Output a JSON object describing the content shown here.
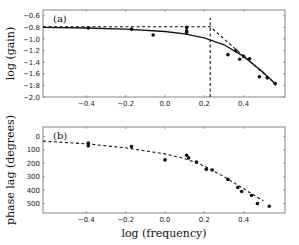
{
  "chart_data": [
    {
      "type": "line",
      "panel_label": "(a)",
      "title": "",
      "xlabel": "",
      "ylabel": "log (gain)",
      "xlim": [
        -0.62,
        0.61
      ],
      "ylim": [
        -2.0,
        -0.5
      ],
      "xticks": [
        -0.4,
        -0.2,
        0.0,
        0.2,
        0.4
      ],
      "xtick_labels": [
        "−0.4",
        "−0.2",
        "0.0",
        "0.2",
        "0.4"
      ],
      "yticks": [
        -0.6,
        -0.8,
        -1.0,
        -1.2,
        -1.4,
        -1.6,
        -1.8,
        -2.0
      ],
      "ytick_labels": [
        "−0.6",
        "−0.8",
        "−1.0",
        "−1.2",
        "−1.4",
        "−1.6",
        "−1.8",
        "−2.0"
      ],
      "grid": false,
      "series": [
        {
          "name": "data",
          "style": "scatter",
          "x": [
            -0.39,
            -0.17,
            -0.06,
            0.11,
            0.11,
            0.11,
            0.32,
            0.36,
            0.38,
            0.4,
            0.43,
            0.48,
            0.52,
            0.56
          ],
          "y": [
            -0.81,
            -0.83,
            -0.93,
            -0.8,
            -0.86,
            -0.89,
            -1.27,
            -1.2,
            -1.35,
            -1.3,
            -1.34,
            -1.65,
            -1.67,
            -1.77
          ]
        },
        {
          "name": "fit",
          "style": "solid",
          "x": [
            -0.62,
            -0.4,
            -0.2,
            0.0,
            0.1,
            0.2,
            0.3,
            0.4,
            0.5,
            0.56
          ],
          "y": [
            -0.8,
            -0.81,
            -0.83,
            -0.87,
            -0.91,
            -0.98,
            -1.1,
            -1.3,
            -1.58,
            -1.77
          ]
        },
        {
          "name": "asymptote",
          "style": "dashed",
          "x": [
            -0.62,
            0.23,
            0.56
          ],
          "y": [
            -0.79,
            -0.79,
            -1.77
          ]
        },
        {
          "name": "corner frequency",
          "style": "dashed-vertical",
          "x": [
            0.23,
            0.23
          ],
          "y": [
            -2.0,
            -0.64
          ]
        }
      ]
    },
    {
      "type": "line",
      "panel_label": "(b)",
      "title": "",
      "xlabel": "log (frequency)",
      "ylabel": "phase lag (degrees)",
      "xlim": [
        -0.62,
        0.61
      ],
      "ylim": [
        570,
        -70
      ],
      "xticks": [
        -0.4,
        -0.2,
        0.0,
        0.2,
        0.4
      ],
      "xtick_labels": [
        "−0.4",
        "−0.2",
        "0.0",
        "0.2",
        "0.4"
      ],
      "yticks": [
        0,
        100,
        200,
        300,
        400,
        500
      ],
      "ytick_labels": [
        "0",
        "100",
        "200",
        "300",
        "400",
        "500"
      ],
      "grid": false,
      "series": [
        {
          "name": "data",
          "style": "scatter",
          "x": [
            -0.39,
            -0.39,
            -0.17,
            0.0,
            0.11,
            0.12,
            0.16,
            0.21,
            0.24,
            0.32,
            0.37,
            0.39,
            0.44,
            0.47,
            0.53
          ],
          "y": [
            50,
            70,
            75,
            175,
            140,
            160,
            190,
            245,
            250,
            320,
            380,
            410,
            440,
            500,
            520
          ]
        },
        {
          "name": "fit",
          "style": "dashed",
          "x": [
            -0.62,
            -0.4,
            -0.2,
            0.0,
            0.1,
            0.2,
            0.3,
            0.4,
            0.5
          ],
          "y": [
            35,
            55,
            85,
            130,
            165,
            220,
            300,
            390,
            480
          ]
        }
      ]
    }
  ]
}
